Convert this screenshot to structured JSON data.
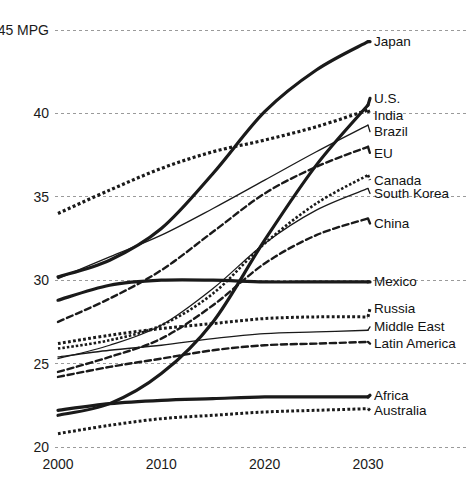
{
  "chart_data": {
    "type": "line",
    "title": "",
    "subtitle": "",
    "xlabel": "",
    "ylabel": "",
    "y_unit_label": "45 MPG",
    "x": [
      2000,
      2005,
      2010,
      2015,
      2020,
      2025,
      2030
    ],
    "xlim": [
      2000,
      2030
    ],
    "ylim": [
      20,
      45
    ],
    "x_ticks": [
      "2000",
      "2010",
      "2020",
      "2030"
    ],
    "x_tick_values": [
      2000,
      2010,
      2020,
      2030
    ],
    "y_ticks": [
      "45 MPG",
      "40",
      "35",
      "30",
      "25",
      "20"
    ],
    "y_tick_values": [
      45,
      40,
      35,
      30,
      25,
      20
    ],
    "grid": true,
    "grid_axis": "y",
    "legend": "right-inline-labels",
    "series": [
      {
        "name": "Japan",
        "label": "Japan",
        "style": "solid",
        "width": 3.2,
        "color": "#1a1a1a",
        "values": [
          30.2,
          31.2,
          33.1,
          36.4,
          40.1,
          42.6,
          44.3
        ],
        "label_y": 44.3
      },
      {
        "name": "U.S.",
        "label": "U.S.",
        "style": "solid",
        "width": 3.2,
        "color": "#1a1a1a",
        "values": [
          21.9,
          22.6,
          24.4,
          27.5,
          32.4,
          36.9,
          40.5
        ],
        "label_y": 40.9
      },
      {
        "name": "India",
        "label": "India",
        "style": "dotted",
        "width": 3.2,
        "color": "#1a1a1a",
        "values": [
          34.0,
          35.4,
          36.7,
          37.7,
          38.4,
          39.2,
          40.2
        ],
        "label_y": 39.9
      },
      {
        "name": "Brazil",
        "label": "Brazil",
        "style": "solid",
        "width": 1.3,
        "color": "#1a1a1a",
        "values": [
          30.1,
          31.4,
          32.7,
          34.3,
          36.0,
          37.7,
          39.3
        ],
        "label_y": 38.9
      },
      {
        "name": "EU",
        "label": "EU",
        "style": "dashed",
        "width": 2.4,
        "color": "#1a1a1a",
        "values": [
          27.5,
          28.9,
          30.6,
          32.9,
          35.2,
          36.8,
          38.0
        ],
        "label_y": 37.6
      },
      {
        "name": "Canada",
        "label": "Canada",
        "style": "dotted",
        "width": 2.6,
        "color": "#1a1a1a",
        "values": [
          25.9,
          26.4,
          27.3,
          29.2,
          32.2,
          34.6,
          36.3
        ],
        "label_y": 36.0
      },
      {
        "name": "South Korea",
        "label": "South Korea",
        "style": "solid",
        "width": 1.3,
        "color": "#1a1a1a",
        "values": [
          25.3,
          26.1,
          27.3,
          29.5,
          32.2,
          34.2,
          35.5
        ],
        "label_y": 35.2
      },
      {
        "name": "China",
        "label": "China",
        "style": "dashed",
        "width": 2.4,
        "color": "#1a1a1a",
        "values": [
          24.5,
          25.4,
          26.5,
          28.5,
          31.0,
          32.7,
          33.7
        ],
        "label_y": 33.4
      },
      {
        "name": "Mexico",
        "label": "Mexico",
        "style": "solid",
        "width": 3.2,
        "color": "#1a1a1a",
        "values": [
          28.8,
          29.7,
          30.0,
          30.0,
          29.9,
          29.9,
          29.9
        ],
        "label_y": 29.9
      },
      {
        "name": "Russia",
        "label": "Russia",
        "style": "dotted",
        "width": 3.0,
        "color": "#1a1a1a",
        "values": [
          26.2,
          26.7,
          27.1,
          27.4,
          27.7,
          27.8,
          27.8
        ],
        "label_y": 28.3
      },
      {
        "name": "Middle East",
        "label": "Middle East",
        "style": "solid",
        "width": 1.3,
        "color": "#1a1a1a",
        "values": [
          25.4,
          25.8,
          26.1,
          26.5,
          26.8,
          26.9,
          27.0
        ],
        "label_y": 27.2
      },
      {
        "name": "Latin America",
        "label": "Latin America",
        "style": "dashed",
        "width": 2.4,
        "color": "#1a1a1a",
        "values": [
          24.2,
          24.8,
          25.3,
          25.8,
          26.1,
          26.2,
          26.3
        ],
        "label_y": 26.2
      },
      {
        "name": "Africa",
        "label": "Africa",
        "style": "solid",
        "width": 3.2,
        "color": "#1a1a1a",
        "values": [
          22.2,
          22.6,
          22.8,
          22.9,
          23.0,
          23.0,
          23.0
        ],
        "label_y": 23.1
      },
      {
        "name": "Australia",
        "label": "Australia",
        "style": "dotted",
        "width": 3.0,
        "color": "#1a1a1a",
        "values": [
          20.8,
          21.3,
          21.7,
          21.9,
          22.1,
          22.2,
          22.3
        ],
        "label_y": 22.2
      }
    ]
  },
  "colors": {
    "line": "#1a1a1a",
    "grid": "#9a9a9a",
    "text": "#111111",
    "background": "#ffffff"
  }
}
